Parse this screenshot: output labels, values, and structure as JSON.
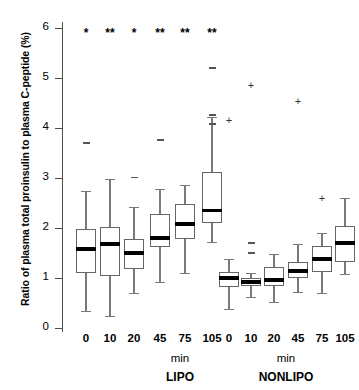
{
  "chart_data": {
    "type": "box",
    "title": "",
    "xlabel": "min",
    "ylabel": "Ratio of plasma total proinsulin to plasma C-peptide (%)",
    "ylim": [
      0,
      6
    ],
    "yticks": [
      0,
      1,
      2,
      3,
      4,
      5,
      6
    ],
    "ytick_labels": [
      "0",
      "1",
      "2",
      "3",
      "4",
      "5",
      "6"
    ],
    "grid": false,
    "legend": "none",
    "groups": [
      {
        "name": "LIPO",
        "unit": "min",
        "categories": [
          "0",
          "10",
          "20",
          "45",
          "75",
          "105"
        ],
        "boxes": [
          {
            "category": "0",
            "whisker_low": 0.35,
            "q1": 1.1,
            "median": 1.58,
            "q3": 1.98,
            "whisker_high": 2.74,
            "significance": "*",
            "outliers": [
              3.72
            ]
          },
          {
            "category": "10",
            "whisker_low": 0.25,
            "q1": 1.05,
            "median": 1.68,
            "q3": 2.02,
            "whisker_high": 2.98,
            "significance": "**",
            "outliers": []
          },
          {
            "category": "20",
            "whisker_low": 0.7,
            "q1": 1.18,
            "median": 1.5,
            "q3": 1.78,
            "whisker_high": 2.42,
            "significance": "*",
            "outliers": [
              3.03
            ]
          },
          {
            "category": "45",
            "whisker_low": 0.92,
            "q1": 1.62,
            "median": 1.8,
            "q3": 2.28,
            "whisker_high": 2.78,
            "significance": "**",
            "outliers": [
              3.78
            ]
          },
          {
            "category": "75",
            "whisker_low": 1.1,
            "q1": 1.78,
            "median": 2.08,
            "q3": 2.48,
            "whisker_high": 2.86,
            "significance": "**",
            "outliers": []
          },
          {
            "category": "105",
            "whisker_low": 1.72,
            "q1": 2.1,
            "median": 2.35,
            "q3": 3.12,
            "whisker_high": 4.22,
            "significance": "**",
            "outliers": [
              4.1,
              4.28,
              5.22
            ]
          }
        ]
      },
      {
        "name": "NONLIPO",
        "unit": "min",
        "categories": [
          "0",
          "10",
          "20",
          "45",
          "75",
          "105"
        ],
        "boxes": [
          {
            "category": "0",
            "whisker_low": 0.38,
            "q1": 0.82,
            "median": 1.0,
            "q3": 1.12,
            "whisker_high": 1.38,
            "significance": "",
            "outliers": [
              4.15
            ]
          },
          {
            "category": "10",
            "whisker_low": 0.62,
            "q1": 0.85,
            "median": 0.92,
            "q3": 1.0,
            "whisker_high": 1.1,
            "significance": "",
            "outliers": [
              1.72,
              1.52,
              4.84
            ]
          },
          {
            "category": "20",
            "whisker_low": 0.52,
            "q1": 0.85,
            "median": 0.96,
            "q3": 1.22,
            "whisker_high": 1.48,
            "significance": "",
            "outliers": []
          },
          {
            "category": "45",
            "whisker_low": 0.72,
            "q1": 1.0,
            "median": 1.14,
            "q3": 1.32,
            "whisker_high": 1.68,
            "significance": "",
            "outliers": [
              4.52
            ]
          },
          {
            "category": "75",
            "whisker_low": 0.7,
            "q1": 1.12,
            "median": 1.38,
            "q3": 1.64,
            "whisker_high": 1.9,
            "significance": "",
            "outliers": [
              2.58
            ]
          },
          {
            "category": "105",
            "whisker_low": 1.08,
            "q1": 1.32,
            "median": 1.7,
            "q3": 2.05,
            "whisker_high": 2.6,
            "significance": "",
            "outliers": []
          }
        ]
      }
    ]
  },
  "axis": {
    "y_title": "Ratio of plasma total proinsulin to plasma C-peptide (%)",
    "tick_0": "0",
    "tick_1": "1",
    "tick_2": "2",
    "tick_3": "3",
    "tick_4": "4",
    "tick_5": "5",
    "tick_6": "6"
  },
  "xaxis": {
    "lipo_labels": [
      "0",
      "10",
      "20",
      "45",
      "75",
      "105"
    ],
    "nonlipo_labels": [
      "0",
      "10",
      "20",
      "45",
      "75",
      "105"
    ],
    "lipo_unit": "min",
    "nonlipo_unit": "min",
    "lipo_name": "LIPO",
    "nonlipo_name": "NONLIPO"
  },
  "annotations": {
    "significance": [
      "*",
      "**",
      "*",
      "**",
      "**",
      "**"
    ]
  },
  "colors": {
    "box_stroke": "#666666",
    "median": "#000000",
    "whisker": "#7a7a7a",
    "axis": "#4d4d4d",
    "text": "#000000",
    "background": "#ffffff"
  }
}
